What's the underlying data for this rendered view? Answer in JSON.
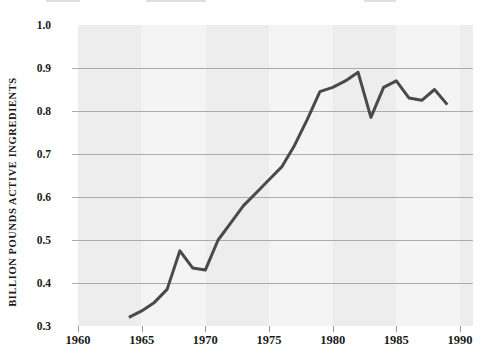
{
  "chart_data": {
    "type": "line",
    "title": "",
    "xlabel": "",
    "ylabel": "BILLION POUNDS ACTIVE INGREDIENTS",
    "legend": "none",
    "grid": "horizontal-only",
    "xlim": [
      1960,
      1991
    ],
    "ylim": [
      0.3,
      1.0
    ],
    "x_ticks": [
      1960,
      1965,
      1970,
      1975,
      1980,
      1985,
      1990
    ],
    "y_ticks": [
      0.3,
      0.4,
      0.5,
      0.6,
      0.7,
      0.8,
      0.9,
      1.0
    ],
    "x": [
      1964,
      1965,
      1966,
      1967,
      1968,
      1969,
      1970,
      1971,
      1972,
      1973,
      1974,
      1975,
      1976,
      1977,
      1978,
      1979,
      1980,
      1981,
      1982,
      1983,
      1984,
      1985,
      1986,
      1987,
      1988,
      1989
    ],
    "values": [
      0.32,
      0.335,
      0.355,
      0.385,
      0.475,
      0.435,
      0.43,
      0.5,
      0.54,
      0.58,
      0.61,
      0.64,
      0.67,
      0.72,
      0.78,
      0.845,
      0.855,
      0.87,
      0.89,
      0.785,
      0.855,
      0.87,
      0.83,
      0.825,
      0.85,
      0.815
    ],
    "colors": {
      "line": "#4a4a4a",
      "gridline": "#ababab",
      "band_dark": "#ededed",
      "band_light": "#f4f4f4",
      "label_text": "#1b1b1b",
      "tick": "#9a9a9a"
    },
    "band_period_years": 5
  }
}
